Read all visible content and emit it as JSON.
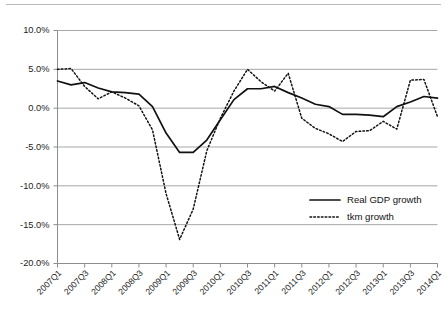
{
  "chart_data": {
    "type": "line",
    "title": "",
    "subtitle": "",
    "xlabel": "",
    "ylabel": "",
    "ylim": [
      -20,
      10
    ],
    "y_ticks": [
      10,
      5,
      0,
      -5,
      -10,
      -15,
      -20
    ],
    "y_tick_labels": [
      "10.0%",
      "5.0%",
      "0.0%",
      "-5.0%",
      "-10.0%",
      "-15.0%",
      "-20.0%"
    ],
    "grid": "horizontal",
    "legend_position": "inside-bottom-right",
    "x": [
      "2007Q1",
      "2007Q2",
      "2007Q3",
      "2007Q4",
      "2008Q1",
      "2008Q2",
      "2008Q3",
      "2008Q4",
      "2009Q1",
      "2009Q2",
      "2009Q3",
      "2009Q4",
      "2010Q1",
      "2010Q2",
      "2010Q3",
      "2010Q4",
      "2011Q1",
      "2011Q2",
      "2011Q3",
      "2011Q4",
      "2012Q1",
      "2012Q2",
      "2012Q3",
      "2012Q4",
      "2013Q1",
      "2013Q2",
      "2013Q3",
      "2013Q4",
      "2014Q1"
    ],
    "x_tick_labels": [
      "2007Q1",
      "2007Q3",
      "2008Q1",
      "2008Q3",
      "2009Q1",
      "2009Q3",
      "2010Q1",
      "2010Q3",
      "2011Q1",
      "2011Q3",
      "2012Q1",
      "2012Q3",
      "2013Q1",
      "2013Q3",
      "2014Q1"
    ],
    "x_tick_indices": [
      0,
      2,
      4,
      6,
      8,
      10,
      12,
      14,
      16,
      18,
      20,
      22,
      24,
      26,
      28
    ],
    "series": [
      {
        "name": "Real GDP growth",
        "style": "solid",
        "color": "#111111",
        "values": [
          3.5,
          3.0,
          3.3,
          2.6,
          2.1,
          2.0,
          1.8,
          0.2,
          -3.2,
          -5.7,
          -5.7,
          -4.1,
          -1.5,
          1.1,
          2.5,
          2.5,
          2.8,
          2.0,
          1.3,
          0.5,
          0.2,
          -0.8,
          -0.8,
          -0.9,
          -1.1,
          0.2,
          0.8,
          1.5,
          1.3
        ]
      },
      {
        "name": "tkm growth",
        "style": "dotted",
        "color": "#111111",
        "values": [
          5.0,
          5.1,
          2.8,
          1.2,
          2.1,
          1.3,
          0.3,
          -2.8,
          -11.0,
          -16.9,
          -13.0,
          -5.5,
          -1.3,
          2.2,
          5.0,
          3.4,
          2.2,
          4.5,
          -1.3,
          -2.6,
          -3.3,
          -4.3,
          -3.0,
          -2.9,
          -1.7,
          -2.7,
          3.6,
          3.7,
          -1.1
        ]
      }
    ]
  },
  "legend": {
    "items": [
      {
        "label": "Real GDP growth",
        "style": "solid"
      },
      {
        "label": "tkm growth",
        "style": "dotted"
      }
    ]
  }
}
